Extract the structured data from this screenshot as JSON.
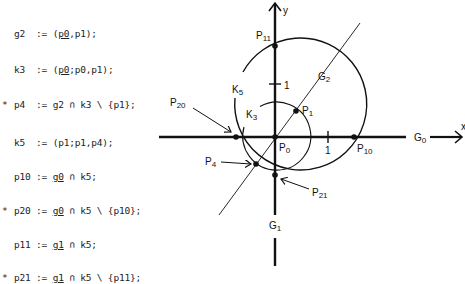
{
  "code": {
    "lines": [
      {
        "marker": "",
        "lhs": "g2",
        "op": ":=",
        "parts": [
          "(",
          "p0",
          ",p1);"
        ],
        "underline_index": 1
      },
      {
        "marker": "",
        "lhs": "k3",
        "op": ":=",
        "parts": [
          "(",
          "p0",
          ";p0,p1);"
        ],
        "underline_index": 1
      },
      {
        "marker": "*",
        "lhs": "p4",
        "op": ":=",
        "parts": [
          "g2 ∩ k3 \\ {p1};"
        ],
        "underline_index": -1
      },
      {
        "marker": "",
        "lhs": "k5",
        "op": ":=",
        "parts": [
          "(p1;p1,p4);"
        ],
        "underline_index": -1
      },
      {
        "marker": "",
        "lhs": "p10",
        "op": ":=",
        "parts": [
          "",
          "g0",
          " ∩ k5;"
        ],
        "underline_index": 1
      },
      {
        "marker": "*",
        "lhs": "p20",
        "op": ":=",
        "parts": [
          "",
          "g0",
          " ∩ k5 \\ {p10};"
        ],
        "underline_index": 1
      },
      {
        "marker": "",
        "lhs": "p11",
        "op": ":=",
        "parts": [
          "",
          "g1",
          " ∩ k5;"
        ],
        "underline_index": 1
      },
      {
        "marker": "*",
        "lhs": "p21",
        "op": ":=",
        "parts": [
          "",
          "g1",
          " ∩ k5 \\ {p11};"
        ],
        "underline_index": 1
      }
    ]
  },
  "diagram": {
    "axis_labels": {
      "x": "x",
      "y": "y"
    },
    "tick_label_x": "1",
    "tick_label_y": "1",
    "lines": {
      "g0": "G",
      "g0_sub": "0",
      "g1": "G",
      "g1_sub": "1",
      "g2": "G",
      "g2_sub": "2"
    },
    "circles": {
      "k3": "K",
      "k3_sub": "3",
      "k5": "K",
      "k5_sub": "5"
    },
    "points": {
      "p0": {
        "base": "P",
        "sub": "0"
      },
      "p1": {
        "base": "P",
        "sub": "1"
      },
      "p4": {
        "base": "P",
        "sub": "4"
      },
      "p10": {
        "base": "P",
        "sub": "10"
      },
      "p11": {
        "base": "P",
        "sub": "11"
      },
      "p20": {
        "base": "P",
        "sub": "20"
      },
      "p21": {
        "base": "P",
        "sub": "21"
      }
    },
    "stroke_color": "#111111"
  }
}
